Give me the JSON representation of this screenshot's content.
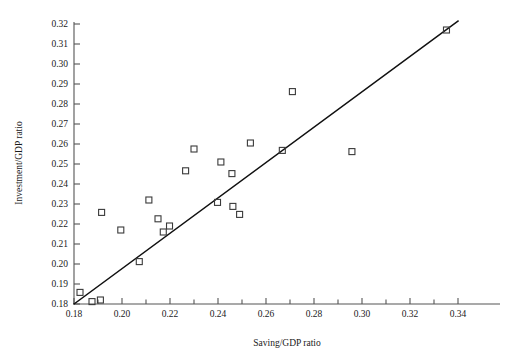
{
  "chart_data": {
    "type": "scatter",
    "title": "",
    "xlabel": "Saving/GDP ratio",
    "ylabel": "Investment/GDP ratio",
    "xlim": [
      0.178,
      0.348
    ],
    "ylim": [
      0.18,
      0.323
    ],
    "grid": false,
    "legend": null,
    "x_major_ticks": [
      0.18,
      0.2,
      0.22,
      0.24,
      0.26,
      0.28,
      0.3,
      0.32,
      0.34
    ],
    "x_major_tick_labels": [
      "0.18",
      "0.20",
      "0.22",
      "0.24",
      "0.26",
      "0.28",
      "0.30",
      "0.32",
      "0.34"
    ],
    "x_minor_ticks": [
      0.19,
      0.21,
      0.23,
      0.25,
      0.27,
      0.29,
      0.31,
      0.33
    ],
    "y_ticks": [
      0.18,
      0.19,
      0.2,
      0.21,
      0.22,
      0.23,
      0.24,
      0.25,
      0.26,
      0.27,
      0.28,
      0.29,
      0.3,
      0.31,
      0.32
    ],
    "y_tick_labels": [
      "0.18",
      "0.19",
      "0.20",
      "0.21",
      "0.22",
      "0.23",
      "0.24",
      "0.25",
      "0.26",
      "0.27",
      "0.28",
      "0.29",
      "0.30",
      "0.31",
      "0.32"
    ],
    "marker_style": "open-square",
    "marker_color": "#3a3a3a",
    "points": [
      {
        "x": 0.1825,
        "y": 0.1858
      },
      {
        "x": 0.1875,
        "y": 0.1812
      },
      {
        "x": 0.191,
        "y": 0.182
      },
      {
        "x": 0.1915,
        "y": 0.2258
      },
      {
        "x": 0.1995,
        "y": 0.217
      },
      {
        "x": 0.2072,
        "y": 0.2012
      },
      {
        "x": 0.2112,
        "y": 0.232
      },
      {
        "x": 0.215,
        "y": 0.2226
      },
      {
        "x": 0.2172,
        "y": 0.216
      },
      {
        "x": 0.2198,
        "y": 0.219
      },
      {
        "x": 0.2265,
        "y": 0.2466
      },
      {
        "x": 0.23,
        "y": 0.2575
      },
      {
        "x": 0.2398,
        "y": 0.2308
      },
      {
        "x": 0.2412,
        "y": 0.251
      },
      {
        "x": 0.2458,
        "y": 0.2452
      },
      {
        "x": 0.2462,
        "y": 0.2288
      },
      {
        "x": 0.249,
        "y": 0.2248
      },
      {
        "x": 0.2535,
        "y": 0.2605
      },
      {
        "x": 0.2668,
        "y": 0.2568
      },
      {
        "x": 0.271,
        "y": 0.2862
      },
      {
        "x": 0.2958,
        "y": 0.2562
      },
      {
        "x": 0.3352,
        "y": 0.317
      }
    ],
    "fit_line": {
      "label": "regression line",
      "x_start": 0.18,
      "y_start": 0.18,
      "x_end": 0.34,
      "y_end": 0.3215
    }
  }
}
